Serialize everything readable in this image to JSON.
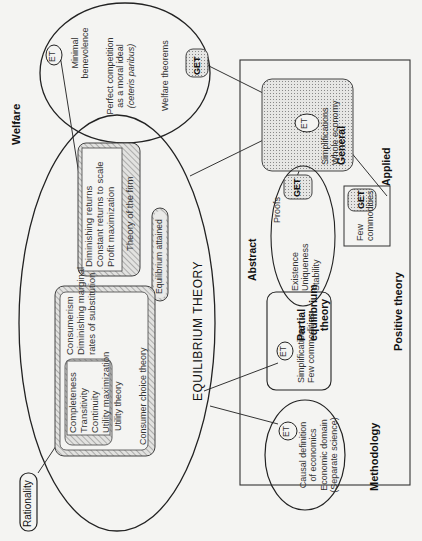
{
  "sections": {
    "welfare": "Welfare",
    "methodology": "Methodology",
    "positive_theory": "Positive theory",
    "abstract": "Abstract",
    "applied": "Applied",
    "rationality": "Rationality",
    "equilibrium_theory": "EQUILIBRIUM THEORY"
  },
  "welfare_ellipse": {
    "badge": "ET",
    "line1": "Minimal",
    "line2": "benevolence",
    "line3": "Perfect competition",
    "line4": "as a moral ideal",
    "line5": "(ceteris paribus)",
    "line6": "Welfare theorems",
    "get_badge": "GET"
  },
  "theory_of_firm": {
    "items": [
      "Diminishing returns",
      "Constant returns to scale",
      "Profit maximization"
    ],
    "title": "Theory of the firm"
  },
  "equilibrium_attained": "Equilibrium attained",
  "consumer_choice": {
    "utility_items": [
      "Completeness",
      "Transitivity",
      "Continuity",
      "Utility maximization"
    ],
    "utility_title": "Utility theory",
    "items": [
      "Consumerism",
      "Diminishing marginal",
      "rates of substitution"
    ],
    "title": "Consumer choice theory"
  },
  "methodology_circle": {
    "badge": "ET",
    "lines": [
      "Causal definition",
      "of economics",
      "Economic domain",
      "(Separate science)"
    ]
  },
  "partial_equilibrium": {
    "badge": "ET",
    "lines": [
      "Simplifications",
      "Few commodities"
    ],
    "title1": "Partial",
    "title2": "equilibrium",
    "title3": "theory"
  },
  "abstract_ellipse": {
    "proofs": "Proofs",
    "get_badge": "GET",
    "lines": [
      "Existence",
      "Uniqueness",
      "Stability"
    ]
  },
  "general_equilibrium": {
    "badge": "ET",
    "lines": [
      "Simplifications",
      "Whole economy"
    ],
    "title1": "General",
    "title2": "Equilibrium",
    "title3": "Theory"
  },
  "few_commodities_box": {
    "line1": "Few",
    "line2": "commodities",
    "get_badge": "GET"
  },
  "colors": {
    "background": "#f4f4f2",
    "stroke": "#333333",
    "dotted_fill": "#d8d8d8",
    "hatch_fill": "#c8c8c8"
  }
}
